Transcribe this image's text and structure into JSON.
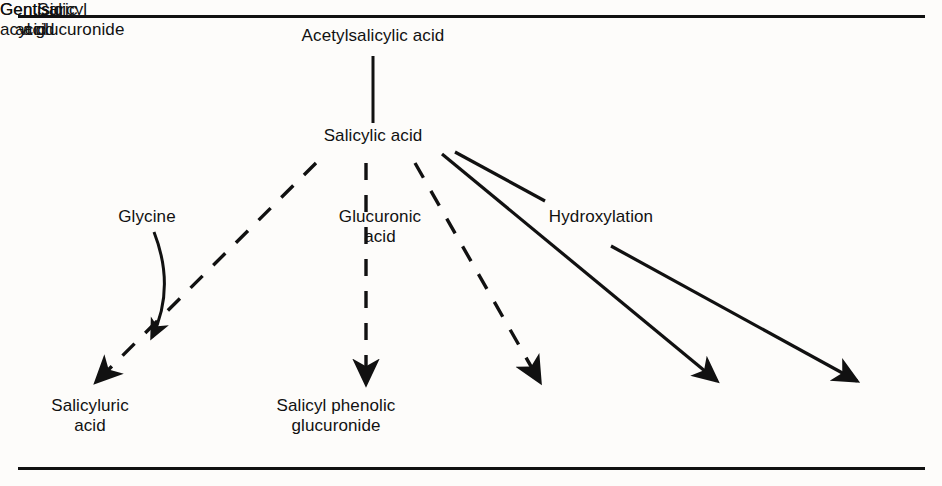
{
  "figure": {
    "background_color": "#fdfcfa",
    "line_color": "#111111",
    "rules": {
      "top_rule_y": 16,
      "bottom_rule_y": 468,
      "left_x": 18,
      "right_x": 925
    }
  },
  "nodes": {
    "parent": "Acetylsalicylic acid",
    "primary_metabolite": "Salicylic acid",
    "products": [
      "Salicyluric\nacid",
      "Salicyl phenolic\nglucuronide",
      "Salicyl\nacyl glucuronide",
      "Gentisic\nacid",
      "Gentisuric\nacid"
    ]
  },
  "cofactors": [
    {
      "label": "Glycine",
      "style": "curved-arrow"
    },
    {
      "label": "Glucuronic\nacid",
      "style": "plain"
    },
    {
      "label": "Hydroxylation",
      "style": "plain"
    }
  ],
  "edges": [
    {
      "from": "Acetylsalicylic acid",
      "to": "Salicylic acid",
      "style": "solid",
      "arrowhead": false
    },
    {
      "from": "Salicylic acid",
      "to": "Salicyluric acid",
      "style": "dashed",
      "arrowhead": true
    },
    {
      "from": "Salicylic acid",
      "to": "Salicyl phenolic glucuronide",
      "style": "dashed",
      "arrowhead": true
    },
    {
      "from": "Salicylic acid",
      "to": "Salicyl acyl glucuronide",
      "style": "dashed",
      "arrowhead": true
    },
    {
      "from": "Salicylic acid",
      "to": "Gentisic acid",
      "style": "solid",
      "arrowhead": true
    },
    {
      "from": "Salicylic acid",
      "to": "Gentisuric acid",
      "style": "solid",
      "arrowhead": true
    }
  ]
}
